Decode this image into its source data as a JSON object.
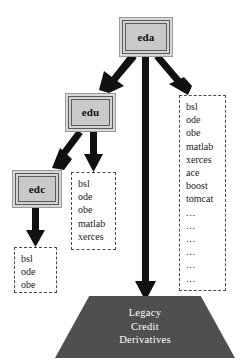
{
  "diagram": {
    "colors": {
      "arrow": "#111111",
      "module_fill": "#c9c9c9",
      "module_border": "#5a5a5a",
      "deplist_border": "#4a4a4a",
      "platform_fill": "#4f4f4f",
      "platform_text": "#ffffff"
    }
  },
  "modules": [
    {
      "id": "eda",
      "label": "eda"
    },
    {
      "id": "edu",
      "label": "edu"
    },
    {
      "id": "edc",
      "label": "edc"
    }
  ],
  "dependency_lists": {
    "eda": {
      "source_module": "eda",
      "items": [
        "bsl",
        "ode",
        "obe",
        "matlab",
        "xerces",
        "ace",
        "boost",
        "tomcat",
        "...",
        "...",
        "...",
        "...",
        "...",
        "..."
      ]
    },
    "edu": {
      "source_module": "edu",
      "items": [
        "bsl",
        "ode",
        "obe",
        "matlab",
        "xerces"
      ]
    },
    "edc": {
      "source_module": "edc",
      "items": [
        "bsl",
        "ode",
        "obe"
      ]
    }
  },
  "platform": {
    "lines": [
      "Legacy",
      "Credit",
      "Derivatives"
    ]
  }
}
